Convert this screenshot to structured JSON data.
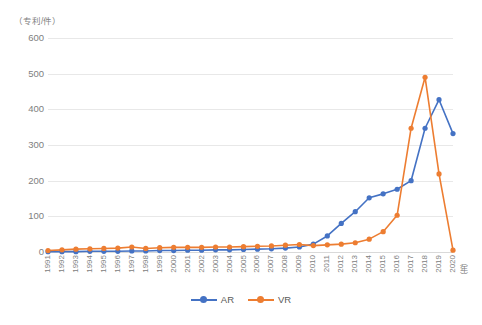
{
  "chart_data": {
    "type": "line",
    "title": "",
    "subtitle": "",
    "xlabel": "（年）",
    "ylabel": "（专利/件）",
    "ylim": [
      0,
      600
    ],
    "ytick_labels": [
      "600",
      "500",
      "400",
      "300",
      "200",
      "100",
      "0"
    ],
    "ytick_values": [
      600,
      500,
      400,
      300,
      200,
      100,
      0
    ],
    "grid": true,
    "legend_position": "bottom",
    "categories": [
      "1991",
      "1992",
      "1993",
      "1994",
      "1995",
      "1996",
      "1997",
      "1998",
      "1999",
      "2000",
      "2001",
      "2002",
      "2003",
      "2004",
      "2005",
      "2006",
      "2007",
      "2008",
      "2009",
      "2010",
      "2011",
      "2012",
      "2013",
      "2014",
      "2015",
      "2016",
      "2017",
      "2018",
      "2019",
      "2020"
    ],
    "series": [
      {
        "name": "AR",
        "color": "#4472C4",
        "values": [
          1,
          1,
          1,
          2,
          2,
          2,
          3,
          3,
          4,
          4,
          5,
          5,
          6,
          6,
          7,
          8,
          9,
          11,
          14,
          22,
          45,
          80,
          113,
          152,
          163,
          176,
          200,
          347,
          427,
          332
        ]
      },
      {
        "name": "VR",
        "color": "#ED7D31",
        "values": [
          4,
          6,
          8,
          9,
          10,
          11,
          14,
          10,
          12,
          13,
          13,
          13,
          14,
          14,
          15,
          16,
          17,
          19,
          21,
          18,
          20,
          22,
          26,
          36,
          57,
          103,
          347,
          490,
          219,
          5
        ]
      }
    ]
  },
  "legend": {
    "items": [
      {
        "label": "AR",
        "color": "#4472C4"
      },
      {
        "label": "VR",
        "color": "#ED7D31"
      }
    ]
  },
  "axes": {
    "y_unit_label": "（专利/件）",
    "x_unit_label": "（年）"
  }
}
